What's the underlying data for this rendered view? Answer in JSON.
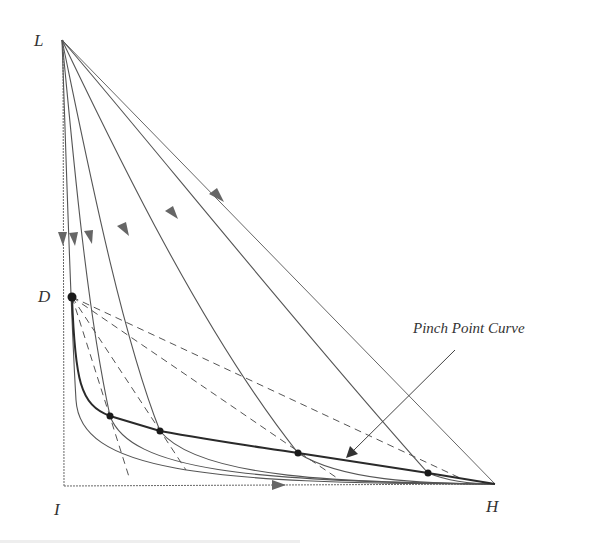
{
  "diagram": {
    "labels": {
      "L": "L",
      "D": "D",
      "I": "I",
      "H": "H"
    },
    "annotation": "Pinch Point Curve",
    "colors": {
      "line": "#555555",
      "arrow": "#666666",
      "bold": "#2a2a2a",
      "point": "#1a1a1a"
    },
    "vertices": {
      "L": [
        62,
        40
      ],
      "D": [
        72,
        297
      ],
      "I": [
        64,
        486
      ],
      "H": [
        495,
        484
      ]
    },
    "pinch_points": [
      [
        110,
        416
      ],
      [
        160,
        431
      ],
      [
        298,
        453
      ],
      [
        428,
        473
      ]
    ]
  }
}
